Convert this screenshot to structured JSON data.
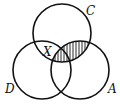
{
  "diagram": {
    "type": "venn-3-set",
    "sets": [
      {
        "id": "C",
        "label": "C",
        "cx": 62,
        "cy": 33,
        "r": 29
      },
      {
        "id": "D",
        "label": "D",
        "cx": 42,
        "cy": 70,
        "r": 29
      },
      {
        "id": "A",
        "label": "A",
        "cx": 80,
        "cy": 70,
        "r": 29
      }
    ],
    "region_label": "X",
    "region_label_location": "C ∩ D (outside A)",
    "shaded_region": "C ∩ A",
    "shading_style": "vertical-hatch",
    "stroke_color": "#111111",
    "background": "#ffffff"
  }
}
